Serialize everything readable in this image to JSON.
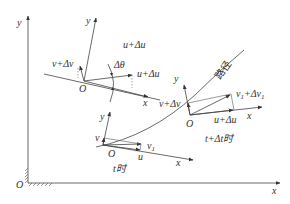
{
  "figure": {
    "type": "kinematics-vector-diagram",
    "global_axes": {
      "origin": "O",
      "x_label": "x",
      "y_label": "y"
    },
    "frame_top_left": {
      "origin": "O",
      "x_label": "x",
      "y_label": "y",
      "vectors": [
        "v+Δv",
        "u+Δu",
        "u+Δu"
      ],
      "angle_label": "Δθ"
    },
    "frame_bottom": {
      "origin": "O",
      "x_label": "x",
      "y_label": "y",
      "vectors": [
        "v",
        "u",
        "v₁"
      ],
      "time_label": "t时"
    },
    "frame_right": {
      "origin": "O",
      "x_label": "x",
      "y_label": "y",
      "vectors": [
        "v+Δv",
        "u+Δu",
        "v₁+Δv₁"
      ],
      "time_label": "t+Δt时"
    },
    "path_label": "路径"
  },
  "labels": {
    "global_origin": "O",
    "global_x": "x",
    "global_y": "y",
    "tl_origin": "O",
    "tl_x": "x",
    "tl_y": "y",
    "tl_v": "v+Δv",
    "tl_u_top": "u+Δu",
    "tl_u_right": "u+Δu",
    "tl_angle": "Δθ",
    "b_origin": "O",
    "b_x": "x",
    "b_y": "y",
    "b_v": "v",
    "b_u": "u",
    "b_v1": "v",
    "b_v1_sub": "1",
    "b_time": "t时",
    "r_origin": "O",
    "r_x": "x",
    "r_y": "y",
    "r_v": "v+Δv",
    "r_u": "u+Δu",
    "r_v1": "v",
    "r_v1_sub": "1",
    "r_v1_plus": "+Δv",
    "r_v1_plus_sub": "1",
    "r_time": "t+Δt时",
    "path": "路径"
  }
}
